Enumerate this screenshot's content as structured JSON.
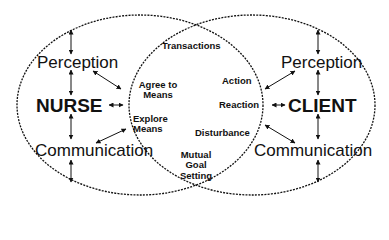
{
  "diagram": {
    "left_system": {
      "title": "NURSE",
      "top": "Perception",
      "bottom": "Communication"
    },
    "right_system": {
      "title": "CLIENT",
      "top": "Perception",
      "bottom": "Communication"
    },
    "overlap": {
      "top": "Transactions",
      "left_items": [
        "Agree to Means",
        "Explore Means"
      ],
      "right_items": [
        "Action",
        "Reaction",
        "Disturbance"
      ],
      "bottom": "Mutual Goal Setting"
    },
    "colors": {
      "line": "#111111",
      "background": "#ffffff"
    }
  }
}
